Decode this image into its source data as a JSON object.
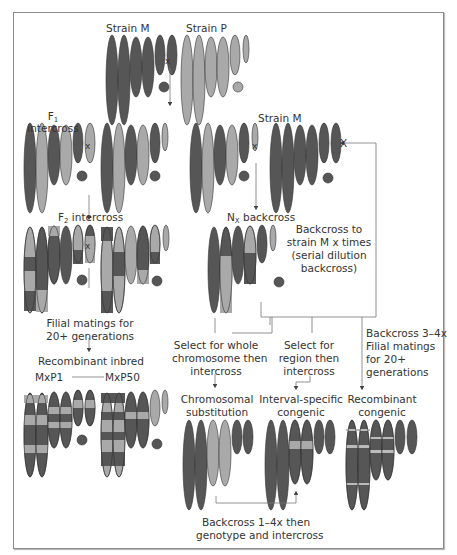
{
  "colors": {
    "strain_m": "#565656",
    "strain_p": "#a9a9a9",
    "line": "#777777",
    "text": "#333333"
  },
  "labels": {
    "strain_m_top": "Strain M",
    "strain_p_top": "Strain P",
    "f1_line1": "F",
    "f1_sub": "1",
    "f1_line2": "intercross",
    "f2_main": "F",
    "f2_sub": "2",
    "f2_rest": " intercross",
    "strain_m_right": "Strain M",
    "nx_main": "N",
    "nx_sub": "X",
    "nx_rest": " backcross",
    "backcross_note_1": "Backcross to",
    "backcross_note_2": "strain M x times",
    "backcross_note_3": "(serial dilution",
    "backcross_note_4": "backcross)",
    "filial_1": "Filial matings for",
    "filial_2": "20+ generations",
    "recombinant_inbred": "Recombinant inbred",
    "mxp1": "MxP1",
    "mxp50": "MxP50",
    "select_whole_1": "Select for whole",
    "select_whole_2": "chromosome then",
    "select_whole_3": "intercross",
    "select_region_1": "Select for",
    "select_region_2": "region then",
    "select_region_3": "intercross",
    "bc34_1": "Backcross 3–4x",
    "bc34_2": "Filial matings",
    "bc34_3": "for 20+",
    "bc34_4": "generations",
    "chromosomal_1": "Chromosomal",
    "chromosomal_2": "substitution",
    "interval_1": "Interval-specific",
    "interval_2": "congenic",
    "recomb_congenic_1": "Recombinant",
    "recomb_congenic_2": "congenic",
    "bc14_1": "Backcross 1–4x then",
    "bc14_2": "genotype and intercross"
  },
  "cross_symbols": [
    "x",
    "x",
    "x",
    "x",
    "X"
  ]
}
